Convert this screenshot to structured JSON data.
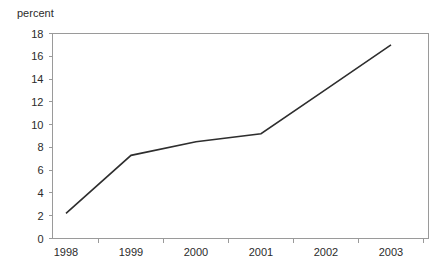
{
  "chart_data": {
    "type": "line",
    "title": "",
    "xlabel": "",
    "ylabel": "percent",
    "categories": [
      "1998",
      "1999",
      "2000",
      "2001",
      "2002",
      "2003"
    ],
    "values": [
      2.2,
      7.3,
      8.5,
      9.2,
      13.1,
      17.0
    ],
    "series": [
      {
        "name": "percent",
        "values": [
          2.2,
          7.3,
          8.5,
          9.2,
          13.1,
          17.0
        ]
      }
    ],
    "ylim": [
      0,
      18
    ],
    "ytick_labels": [
      "0",
      "2",
      "4",
      "6",
      "8",
      "10",
      "12",
      "14",
      "16",
      "18"
    ],
    "ytick_values": [
      0,
      2,
      4,
      6,
      8,
      10,
      12,
      14,
      16,
      18
    ],
    "grid": false,
    "legend": false,
    "legend_position": "none",
    "line_color": "#2e2e2e",
    "axis_color": "#9a9a9a",
    "background_color": "#ffffff"
  },
  "axis": {
    "y_axis_title": "percent"
  }
}
